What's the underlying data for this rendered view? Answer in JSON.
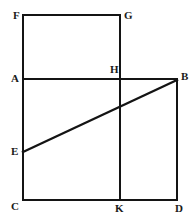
{
  "figure": {
    "type": "geometry-diagram",
    "background_color": "#ffffff",
    "stroke_color": "#141414",
    "label_color": "#1a1a1a",
    "width": 196,
    "height": 223,
    "points": [
      {
        "id": "F",
        "label": "F",
        "x": 23,
        "y": 15,
        "label_x": 13,
        "label_y": 10
      },
      {
        "id": "G",
        "label": "G",
        "x": 120,
        "y": 15,
        "label_x": 124,
        "label_y": 10
      },
      {
        "id": "A",
        "label": "A",
        "x": 23,
        "y": 79,
        "label_x": 11,
        "label_y": 73
      },
      {
        "id": "H",
        "label": "H",
        "x": 120,
        "y": 79,
        "label_x": 110,
        "label_y": 64
      },
      {
        "id": "B",
        "label": "B",
        "x": 177,
        "y": 79,
        "label_x": 181,
        "label_y": 71
      },
      {
        "id": "E",
        "label": "E",
        "x": 23,
        "y": 152,
        "label_x": 11,
        "label_y": 146
      },
      {
        "id": "C",
        "label": "C",
        "x": 23,
        "y": 200,
        "label_x": 11,
        "label_y": 201
      },
      {
        "id": "K",
        "label": "K",
        "x": 120,
        "y": 200,
        "label_x": 115,
        "label_y": 203
      },
      {
        "id": "D",
        "label": "D",
        "x": 177,
        "y": 200,
        "label_x": 175,
        "label_y": 203
      }
    ],
    "segments": [
      {
        "id": "FG",
        "name": "segment-fg",
        "x1": 23,
        "y1": 15,
        "x2": 120,
        "y2": 15,
        "weight": "normal"
      },
      {
        "id": "FC",
        "name": "segment-fc",
        "x1": 23,
        "y1": 15,
        "x2": 23,
        "y2": 200,
        "weight": "normal"
      },
      {
        "id": "GK",
        "name": "segment-gk",
        "x1": 120,
        "y1": 15,
        "x2": 120,
        "y2": 200,
        "weight": "normal"
      },
      {
        "id": "AB",
        "name": "segment-ab",
        "x1": 23,
        "y1": 79,
        "x2": 177,
        "y2": 79,
        "weight": "normal"
      },
      {
        "id": "BD",
        "name": "segment-bd",
        "x1": 177,
        "y1": 79,
        "x2": 177,
        "y2": 200,
        "weight": "normal"
      },
      {
        "id": "CD",
        "name": "segment-cd",
        "x1": 23,
        "y1": 200,
        "x2": 177,
        "y2": 200,
        "weight": "normal"
      },
      {
        "id": "EB",
        "name": "segment-eb",
        "x1": 23,
        "y1": 152,
        "x2": 177,
        "y2": 80,
        "weight": "thick"
      }
    ]
  }
}
